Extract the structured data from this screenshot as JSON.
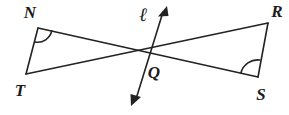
{
  "figure": {
    "kind": "geometry-diagram",
    "background_color": "#ffffff",
    "stroke_color": "#222222",
    "label_color": "#1b1b1b",
    "width": 289,
    "height": 115,
    "labels": {
      "n": "N",
      "t": "T",
      "r": "R",
      "s": "S",
      "q": "Q",
      "line": "ℓ"
    },
    "points": {
      "n": {
        "x": 38,
        "y": 28
      },
      "t": {
        "x": 26,
        "y": 74
      },
      "r": {
        "x": 268,
        "y": 23
      },
      "s": {
        "x": 258,
        "y": 77
      },
      "q": {
        "x": 148,
        "y": 53
      },
      "line_top": {
        "x": 167,
        "y": 7
      },
      "line_bottom": {
        "x": 132,
        "y": 104
      }
    },
    "segments": [
      {
        "name": "segment-NS",
        "from": "n",
        "to": "s"
      },
      {
        "name": "segment-TR",
        "from": "t",
        "to": "r"
      },
      {
        "name": "segment-NT",
        "from": "n",
        "to": "t"
      },
      {
        "name": "segment-RS",
        "from": "r",
        "to": "s"
      }
    ],
    "angle_marks": [
      {
        "name": "angle-mark-N",
        "vertex": "n"
      },
      {
        "name": "angle-mark-S",
        "vertex": "s"
      }
    ],
    "line_l": {
      "name": "line-l",
      "arrow_both_ends": true
    }
  }
}
